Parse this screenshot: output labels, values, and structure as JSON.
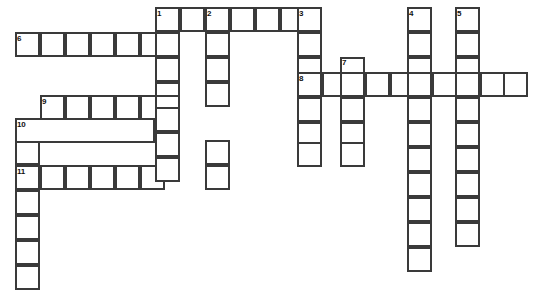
{
  "puzzle": {
    "type": "crossword-grid",
    "title": "Crossword puzzle grid",
    "width": 533,
    "height": 294,
    "cell_size": 25,
    "colors": {
      "background": "#ffffff",
      "cell_fill": "#ffffff",
      "cell_border": "#3a3a3a",
      "number_text": "#111111"
    },
    "clue_numbers": [
      {
        "number": "1",
        "x": 157,
        "y": 10
      },
      {
        "number": "2",
        "x": 207,
        "y": 10
      },
      {
        "number": "3",
        "x": 299,
        "y": 10
      },
      {
        "number": "4",
        "x": 409,
        "y": 10
      },
      {
        "number": "5",
        "x": 457,
        "y": 10
      },
      {
        "number": "6",
        "x": 17,
        "y": 35
      },
      {
        "number": "7",
        "x": 342,
        "y": 59
      },
      {
        "number": "8",
        "x": 299,
        "y": 75
      },
      {
        "number": "9",
        "x": 42,
        "y": 98
      },
      {
        "number": "10",
        "x": 17,
        "y": 121
      },
      {
        "number": "11",
        "x": 17,
        "y": 168
      }
    ],
    "across_entries": [
      {
        "number": "1",
        "x": 155,
        "y": 7,
        "length": 7,
        "orientation": "across"
      },
      {
        "number": "6",
        "x": 15,
        "y": 32,
        "length": 7,
        "orientation": "across"
      },
      {
        "number": "8",
        "x": 297,
        "y": 72,
        "length": 9,
        "orientation": "across"
      },
      {
        "number": "9",
        "x": 40,
        "y": 95,
        "length": 6,
        "orientation": "across"
      },
      {
        "number": "11",
        "x": 15,
        "y": 165,
        "length": 6,
        "orientation": "across"
      }
    ],
    "down_entries": [
      {
        "number": "1",
        "x": 155,
        "y": 7,
        "length": 8,
        "orientation": "down"
      },
      {
        "number": "2",
        "x": 205,
        "y": 7,
        "length": 8,
        "orientation": "down"
      },
      {
        "number": "3",
        "x": 297,
        "y": 7,
        "length": 7,
        "orientation": "down"
      },
      {
        "number": "4",
        "x": 407,
        "y": 7,
        "length": 10,
        "orientation": "down"
      },
      {
        "number": "5",
        "x": 455,
        "y": 7,
        "length": 10,
        "orientation": "down"
      },
      {
        "number": "7",
        "x": 340,
        "y": 57,
        "length": 5,
        "orientation": "down"
      },
      {
        "number": "10",
        "x": 15,
        "y": 118,
        "length": 7,
        "orientation": "down"
      }
    ],
    "cells": [
      {
        "x": 155,
        "y": 7
      },
      {
        "x": 180,
        "y": 7
      },
      {
        "x": 205,
        "y": 7
      },
      {
        "x": 230,
        "y": 7
      },
      {
        "x": 255,
        "y": 7
      },
      {
        "x": 280,
        "y": 7
      },
      {
        "x": 297,
        "y": 7
      },
      {
        "x": 407,
        "y": 7
      },
      {
        "x": 455,
        "y": 7
      },
      {
        "x": 15,
        "y": 32
      },
      {
        "x": 40,
        "y": 32
      },
      {
        "x": 65,
        "y": 32
      },
      {
        "x": 90,
        "y": 32
      },
      {
        "x": 115,
        "y": 32
      },
      {
        "x": 140,
        "y": 32
      },
      {
        "x": 155,
        "y": 32
      },
      {
        "x": 205,
        "y": 32
      },
      {
        "x": 297,
        "y": 32
      },
      {
        "x": 407,
        "y": 32
      },
      {
        "x": 455,
        "y": 32
      },
      {
        "x": 155,
        "y": 57
      },
      {
        "x": 205,
        "y": 57
      },
      {
        "x": 297,
        "y": 57
      },
      {
        "x": 340,
        "y": 57
      },
      {
        "x": 407,
        "y": 57
      },
      {
        "x": 455,
        "y": 57
      },
      {
        "x": 297,
        "y": 72
      },
      {
        "x": 322,
        "y": 72
      },
      {
        "x": 340,
        "y": 72
      },
      {
        "x": 365,
        "y": 72
      },
      {
        "x": 390,
        "y": 72
      },
      {
        "x": 407,
        "y": 72
      },
      {
        "x": 432,
        "y": 72
      },
      {
        "x": 455,
        "y": 72
      },
      {
        "x": 480,
        "y": 72
      },
      {
        "x": 503,
        "y": 72
      },
      {
        "x": 155,
        "y": 82
      },
      {
        "x": 205,
        "y": 82
      },
      {
        "x": 40,
        "y": 95
      },
      {
        "x": 65,
        "y": 95
      },
      {
        "x": 90,
        "y": 95
      },
      {
        "x": 115,
        "y": 95
      },
      {
        "x": 140,
        "y": 95
      },
      {
        "x": 155,
        "y": 95
      },
      {
        "x": 297,
        "y": 97
      },
      {
        "x": 340,
        "y": 97
      },
      {
        "x": 407,
        "y": 97
      },
      {
        "x": 455,
        "y": 97
      },
      {
        "x": 15,
        "y": 118
      },
      {
        "x": 155,
        "y": 107
      },
      {
        "x": 297,
        "y": 122
      },
      {
        "x": 340,
        "y": 122
      },
      {
        "x": 407,
        "y": 122
      },
      {
        "x": 455,
        "y": 122
      },
      {
        "x": 15,
        "y": 140
      },
      {
        "x": 155,
        "y": 132
      },
      {
        "x": 205,
        "y": 140
      },
      {
        "x": 297,
        "y": 142
      },
      {
        "x": 340,
        "y": 142
      },
      {
        "x": 407,
        "y": 147
      },
      {
        "x": 455,
        "y": 147
      },
      {
        "x": 15,
        "y": 165
      },
      {
        "x": 40,
        "y": 165
      },
      {
        "x": 65,
        "y": 165
      },
      {
        "x": 90,
        "y": 165
      },
      {
        "x": 115,
        "y": 165
      },
      {
        "x": 140,
        "y": 165
      },
      {
        "x": 155,
        "y": 157
      },
      {
        "x": 205,
        "y": 165
      },
      {
        "x": 407,
        "y": 172
      },
      {
        "x": 455,
        "y": 172
      },
      {
        "x": 15,
        "y": 190
      },
      {
        "x": 407,
        "y": 197
      },
      {
        "x": 455,
        "y": 197
      },
      {
        "x": 15,
        "y": 215
      },
      {
        "x": 407,
        "y": 222
      },
      {
        "x": 455,
        "y": 222
      },
      {
        "x": 15,
        "y": 240
      },
      {
        "x": 407,
        "y": 247
      },
      {
        "x": 15,
        "y": 265
      }
    ],
    "bands": [
      {
        "x": 15,
        "y": 118,
        "width": 140
      }
    ]
  }
}
